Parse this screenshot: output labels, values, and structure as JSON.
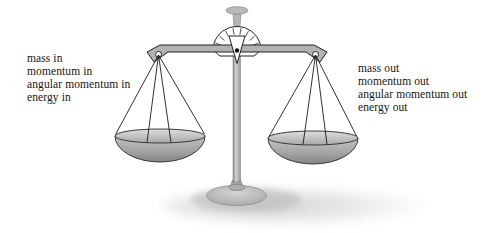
{
  "figure": {
    "left_label": {
      "lines": [
        "mass in",
        "momentum in",
        "angular momentum in",
        "energy in"
      ]
    },
    "right_label": {
      "lines": [
        "mass out",
        "momentum out",
        "angular momentum out",
        "energy out"
      ]
    },
    "colors": {
      "metal_gray": "#b2b2b2",
      "outline": "#222222",
      "pan_rim_light": "#d9d9d9",
      "pan_bowl_dark": "#8a8a8a",
      "shadow_gray": "#c6c6c6",
      "background": "#ffffff"
    }
  }
}
